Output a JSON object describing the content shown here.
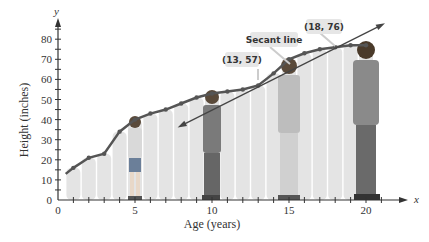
{
  "chart_data": {
    "type": "line",
    "title": "",
    "xlabel": "Age (years)",
    "ylabel": "Height (inches)",
    "x_axis_letter": "x",
    "y_axis_letter": "y",
    "xlim": [
      0,
      22
    ],
    "ylim": [
      0,
      88
    ],
    "x_ticks": [
      0,
      5,
      10,
      15,
      20
    ],
    "y_ticks": [
      0,
      10,
      20,
      30,
      40,
      50,
      60,
      70,
      80
    ],
    "grid": false,
    "series": [
      {
        "name": "Height curve",
        "x": [
          0.5,
          1,
          2,
          3,
          4,
          5,
          6,
          7,
          8,
          9,
          10,
          11,
          12,
          13,
          14,
          15,
          16,
          17,
          18,
          19,
          20
        ],
        "values": [
          13,
          16,
          21,
          23,
          34,
          40,
          43,
          45,
          48,
          51,
          53,
          54,
          55,
          57,
          63,
          70,
          73,
          75,
          76,
          77,
          77
        ]
      },
      {
        "name": "Secant line",
        "points": [
          [
            8,
            37
          ],
          [
            13,
            57
          ],
          [
            18,
            76
          ],
          [
            21,
            87
          ]
        ]
      }
    ],
    "annotations": [
      {
        "label": "(13, 57)",
        "x": 13,
        "y": 57
      },
      {
        "label": "(18, 76)",
        "x": 18,
        "y": 76
      },
      {
        "label": "Secant line"
      }
    ]
  }
}
